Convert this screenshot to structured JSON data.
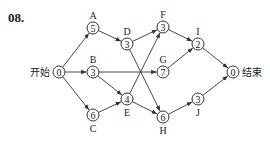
{
  "question_number": "08.",
  "diagram": {
    "type": "activity-network",
    "nodes": [
      {
        "id": "start",
        "value": "0",
        "side_label": "开始",
        "x": 59,
        "y": 72
      },
      {
        "id": "A",
        "value": "5",
        "label": "A",
        "label_pos": "above",
        "x": 93,
        "y": 28
      },
      {
        "id": "B",
        "value": "3",
        "label": "B",
        "label_pos": "above",
        "x": 93,
        "y": 72
      },
      {
        "id": "C",
        "value": "6",
        "label": "C",
        "label_pos": "below",
        "x": 93,
        "y": 115
      },
      {
        "id": "D",
        "value": "3",
        "label": "D",
        "label_pos": "above",
        "x": 127,
        "y": 44
      },
      {
        "id": "E",
        "value": "4",
        "label": "E",
        "label_pos": "below",
        "x": 127,
        "y": 99
      },
      {
        "id": "F",
        "value": "3",
        "label": "F",
        "label_pos": "above",
        "x": 163,
        "y": 27
      },
      {
        "id": "G",
        "value": "7",
        "label": "G",
        "label_pos": "above",
        "x": 163,
        "y": 72
      },
      {
        "id": "H",
        "value": "6",
        "label": "H",
        "label_pos": "below",
        "x": 163,
        "y": 117
      },
      {
        "id": "I",
        "value": "2",
        "label": "I",
        "label_pos": "above",
        "x": 198,
        "y": 44
      },
      {
        "id": "J",
        "value": "3",
        "label": "J",
        "label_pos": "below",
        "x": 198,
        "y": 99
      },
      {
        "id": "end",
        "value": "0",
        "side_label": "结束",
        "x": 233,
        "y": 72
      }
    ],
    "edges": [
      [
        "start",
        "A"
      ],
      [
        "start",
        "B"
      ],
      [
        "start",
        "C"
      ],
      [
        "A",
        "D"
      ],
      [
        "B",
        "G"
      ],
      [
        "B",
        "E"
      ],
      [
        "C",
        "E"
      ],
      [
        "D",
        "F"
      ],
      [
        "D",
        "H"
      ],
      [
        "E",
        "F"
      ],
      [
        "E",
        "H"
      ],
      [
        "F",
        "I"
      ],
      [
        "G",
        "I"
      ],
      [
        "H",
        "J"
      ],
      [
        "I",
        "end"
      ],
      [
        "J",
        "end"
      ]
    ]
  }
}
